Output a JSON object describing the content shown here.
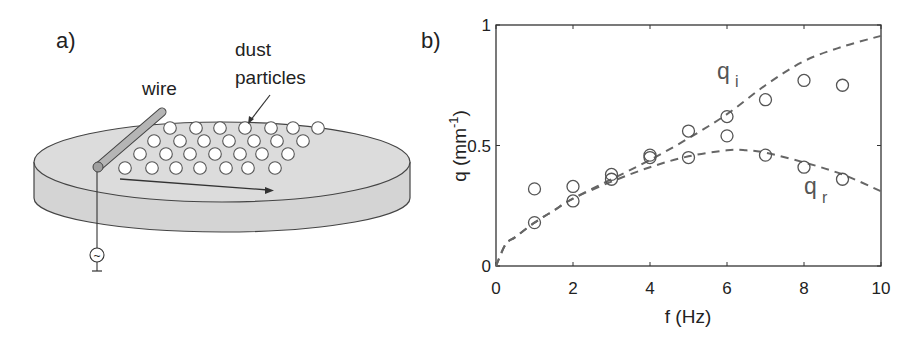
{
  "figure": {
    "panel_a": {
      "label": "a)",
      "annotations": {
        "wire": "wire",
        "dust_line1": "dust",
        "dust_line2": "particles"
      },
      "colors": {
        "disk": "#d9d9d9",
        "wire": "#b3b3b3",
        "particle": "#ffffff",
        "stroke": "#444444"
      },
      "icons": {
        "source": "ac-source-icon",
        "ground": "ground-icon"
      },
      "source_glyph": "~"
    },
    "panel_b": {
      "label": "b)"
    }
  },
  "chart_data": {
    "type": "scatter",
    "title": "",
    "xlabel": "f (Hz)",
    "ylabel": "q (mm",
    "ylabel_sup": "-1",
    "ylabel_close": ")",
    "xlim": [
      0,
      10
    ],
    "ylim": [
      0,
      1
    ],
    "xticks": [
      0,
      2,
      4,
      6,
      8,
      10
    ],
    "yticks": [
      0,
      0.5,
      1
    ],
    "xtick_labels": [
      "0",
      "2",
      "4",
      "6",
      "8",
      "10"
    ],
    "ytick_labels": [
      "0",
      "0.5",
      "1"
    ],
    "grid": false,
    "legend": "none (inline curve labels)",
    "series": [
      {
        "name": "q_i",
        "label_main": "q",
        "label_sub": "i",
        "marker": "open-circle",
        "x": [
          1,
          2,
          3,
          4,
          5,
          6,
          7,
          8,
          9
        ],
        "values": [
          0.18,
          0.27,
          0.38,
          0.46,
          0.56,
          0.62,
          0.69,
          0.77,
          0.75
        ]
      },
      {
        "name": "q_r",
        "label_main": "q",
        "label_sub": "r",
        "marker": "open-circle",
        "x": [
          1,
          2,
          3,
          4,
          5,
          6,
          7,
          8,
          9
        ],
        "values": [
          0.32,
          0.33,
          0.36,
          0.45,
          0.45,
          0.54,
          0.46,
          0.41,
          0.36
        ]
      }
    ],
    "fit_curves": [
      {
        "name": "q_i fit",
        "style": "dashed",
        "x": [
          0,
          0.25,
          0.5,
          1,
          1.5,
          2,
          3,
          4,
          5,
          6,
          7,
          8,
          9,
          10
        ],
        "values": [
          0.0,
          0.09,
          0.12,
          0.18,
          0.23,
          0.28,
          0.36,
          0.44,
          0.53,
          0.63,
          0.75,
          0.85,
          0.91,
          0.955
        ]
      },
      {
        "name": "q_r fit",
        "style": "dashed",
        "x": [
          0,
          0.25,
          0.5,
          1,
          1.5,
          2,
          3,
          4,
          5,
          6,
          6.5,
          7,
          8,
          9,
          10
        ],
        "values": [
          0.0,
          0.09,
          0.12,
          0.18,
          0.23,
          0.28,
          0.35,
          0.41,
          0.455,
          0.48,
          0.48,
          0.47,
          0.43,
          0.38,
          0.31
        ]
      }
    ],
    "colors": {
      "axes": "#333333",
      "markers": "#555555",
      "curves": "#666666"
    }
  }
}
